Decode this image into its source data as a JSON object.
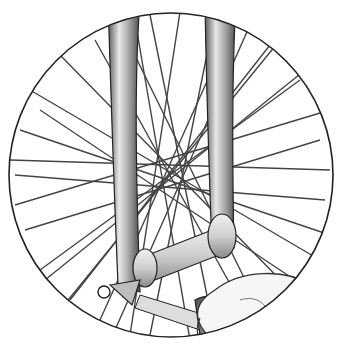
{
  "illustration": {
    "subject": "hand adjusting bicycle front wheel hub quick-release",
    "style": "grayscale line illustration",
    "frame": {
      "cx": 171,
      "cy": 175,
      "r": 163,
      "stroke": "#222222"
    },
    "hub": {
      "cx": 185,
      "cy": 190
    },
    "colors": {
      "background": "#ffffff",
      "line": "#333333",
      "fork_fill": "#9a9a9a",
      "fork_highlight": "#e6e6e6",
      "hub_fill": "#d8d8d8",
      "hand_fill": "#f4f4f4",
      "tool_fill": "#7a7a7a"
    },
    "spokes": [
      [
        120,
        25,
        255,
        300
      ],
      [
        150,
        15,
        215,
        335
      ],
      [
        215,
        15,
        150,
        335
      ],
      [
        250,
        25,
        115,
        330
      ],
      [
        30,
        90,
        320,
        260
      ],
      [
        20,
        130,
        330,
        235
      ],
      [
        15,
        175,
        325,
        200
      ],
      [
        25,
        230,
        320,
        140
      ],
      [
        40,
        270,
        300,
        80
      ],
      [
        70,
        300,
        270,
        45
      ],
      [
        100,
        320,
        230,
        30
      ],
      [
        180,
        12,
        130,
        335
      ],
      [
        10,
        160,
        330,
        170
      ],
      [
        60,
        55,
        300,
        300
      ],
      [
        280,
        40,
        60,
        310
      ],
      [
        15,
        205,
        330,
        110
      ],
      [
        40,
        110,
        310,
        290
      ],
      [
        95,
        40,
        250,
        320
      ],
      [
        305,
        70,
        45,
        280
      ],
      [
        135,
        20,
        190,
        340
      ]
    ]
  }
}
